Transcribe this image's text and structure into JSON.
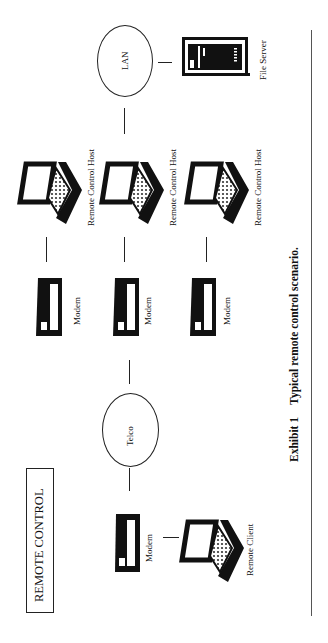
{
  "title_box": {
    "label": "REMOTE CONTROL"
  },
  "caption": {
    "exhibit": "Exhibit 1",
    "text": "Typical remote control scenario."
  },
  "nodes": {
    "lan": {
      "label": "LAN"
    },
    "telco": {
      "label": "Telco"
    },
    "file_server": {
      "label": "File Server"
    },
    "hosts": [
      {
        "label": "Remote Control Host"
      },
      {
        "label": "Remote Control Host"
      },
      {
        "label": "Remote Control Host"
      }
    ],
    "host_modems": [
      {
        "label": "Modem"
      },
      {
        "label": "Modem"
      },
      {
        "label": "Modem"
      }
    ],
    "client_modem": {
      "label": "Modem"
    },
    "client": {
      "label": "Remote Client"
    }
  },
  "icons": {
    "laptop": "laptop-icon",
    "modem": "modem-icon",
    "server": "server-icon"
  },
  "colors": {
    "ink": "#111111",
    "background": "#ffffff"
  }
}
